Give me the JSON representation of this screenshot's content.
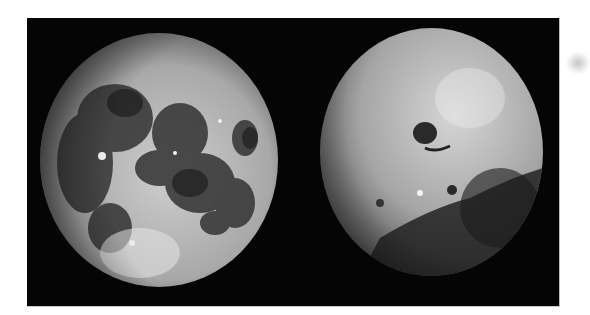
{
  "image": {
    "description": "Two photographs of the Moon side by side on a black background",
    "background_color": "#050505",
    "page_color": "#ffffff",
    "panels": [
      {
        "id": "left",
        "subject": "Moon near side",
        "features": [
          "dark maria",
          "bright highland regions",
          "ray crater near bottom"
        ]
      },
      {
        "id": "right",
        "subject": "Moon far side",
        "features": [
          "heavily cratered bright highlands",
          "dark crater basin near center",
          "dark maria in lower right"
        ]
      }
    ]
  }
}
